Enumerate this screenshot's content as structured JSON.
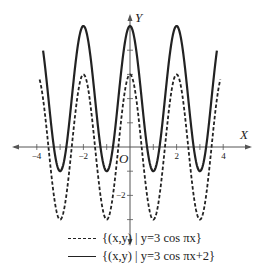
{
  "chart_data": {
    "type": "line",
    "title": "",
    "xlabel": "X",
    "ylabel": "Y",
    "origin_label": "O",
    "xlim": [
      -4.5,
      4.5
    ],
    "ylim": [
      -3.5,
      5.3
    ],
    "grid": false,
    "x_tick_labels": [
      {
        "v": -4,
        "t": "−4"
      },
      {
        "v": -2,
        "t": "−2"
      },
      {
        "v": 2,
        "t": "2"
      },
      {
        "v": 4,
        "t": "4"
      }
    ],
    "y_tick_labels": [
      {
        "v": -2,
        "t": "−2"
      }
    ],
    "x_ticks": [
      -4,
      -3,
      -2,
      -1,
      1,
      2,
      3,
      4
    ],
    "y_ticks": [
      -3,
      -2,
      -1,
      1,
      2,
      3,
      4
    ],
    "series": [
      {
        "name": "{(x,y) | y=3 cos πx}",
        "style": "dashed",
        "expr": "3*cos(pi*x)",
        "x_range": [
          -3.88,
          3.88
        ],
        "amplitude": 3,
        "shift": 0
      },
      {
        "name": "{(x,y) | y=3 cos πx+2}",
        "style": "solid",
        "expr": "3*cos(pi*x)+2",
        "x_range": [
          -3.73,
          3.73
        ],
        "amplitude": 3,
        "shift": 2
      }
    ],
    "legend_position": "bottom"
  },
  "legend": {
    "dashed_label": "{(x,y) | y=3 cos πx}",
    "solid_label": "{(x,y) | y=3 cos πx+2}"
  },
  "axes": {
    "x_name": "X",
    "y_name": "Y",
    "origin": "O"
  },
  "colors": {
    "ink": "#222222",
    "axis": "#555555",
    "background": "#ffffff"
  }
}
